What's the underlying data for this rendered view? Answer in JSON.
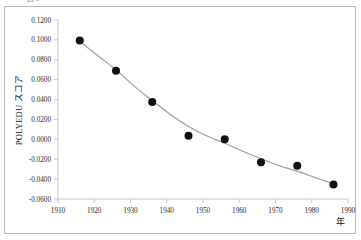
{
  "figure": {
    "caption_fragment": "図 2",
    "background_color": "#ffffff",
    "frame_color": "#b9b9b9"
  },
  "chart_data": {
    "type": "scatter",
    "title": "",
    "subtitle": "",
    "xlabel": "年",
    "ylabel": "POLYEDU スコア",
    "xlim": [
      1910,
      1990
    ],
    "ylim": [
      -0.06,
      0.12
    ],
    "xticks": [
      1910,
      1920,
      1930,
      1940,
      1950,
      1960,
      1970,
      1980,
      1990
    ],
    "xtick_labels": [
      "1910",
      "1920",
      "1930",
      "1940",
      "1950",
      "1960",
      "1970",
      "1980",
      "1990"
    ],
    "yticks": [
      -0.06,
      -0.04,
      -0.02,
      0.0,
      0.02,
      0.04,
      0.06,
      0.08,
      0.1,
      0.12
    ],
    "ytick_labels": [
      "-0.0600",
      "-0.0400",
      "-0.0200",
      "0.0000",
      "0.0200",
      "0.0400",
      "0.0600",
      "0.0800",
      "0.1000",
      "0.1200"
    ],
    "grid": false,
    "legend": "none",
    "marker_color": "#111111",
    "marker_shape": "circle",
    "marker_size": 5.2,
    "trendline_color": "#9b9b9b",
    "trendline_style": "smooth",
    "x": [
      1916,
      1926,
      1936,
      1946,
      1956,
      1966,
      1976,
      1986
    ],
    "values": [
      0.0995,
      0.069,
      0.0375,
      0.0035,
      0.0,
      -0.023,
      -0.0265,
      -0.0455
    ],
    "series": [
      {
        "name": "POLYEDU スコア",
        "x": [
          1916,
          1926,
          1936,
          1946,
          1956,
          1966,
          1976,
          1986
        ],
        "values": [
          0.0995,
          0.069,
          0.0375,
          0.0035,
          0.0,
          -0.023,
          -0.0265,
          -0.0455
        ]
      }
    ],
    "trendline_points": [
      {
        "x": 1916,
        "y": 0.0985
      },
      {
        "x": 1921,
        "y": 0.084
      },
      {
        "x": 1926,
        "y": 0.07
      },
      {
        "x": 1931,
        "y": 0.0535
      },
      {
        "x": 1936,
        "y": 0.039
      },
      {
        "x": 1941,
        "y": 0.025
      },
      {
        "x": 1946,
        "y": 0.013
      },
      {
        "x": 1951,
        "y": 0.0035
      },
      {
        "x": 1956,
        "y": -0.004
      },
      {
        "x": 1961,
        "y": -0.012
      },
      {
        "x": 1966,
        "y": -0.0195
      },
      {
        "x": 1971,
        "y": -0.0265
      },
      {
        "x": 1976,
        "y": -0.032
      },
      {
        "x": 1981,
        "y": -0.0385
      },
      {
        "x": 1986,
        "y": -0.045
      }
    ]
  }
}
